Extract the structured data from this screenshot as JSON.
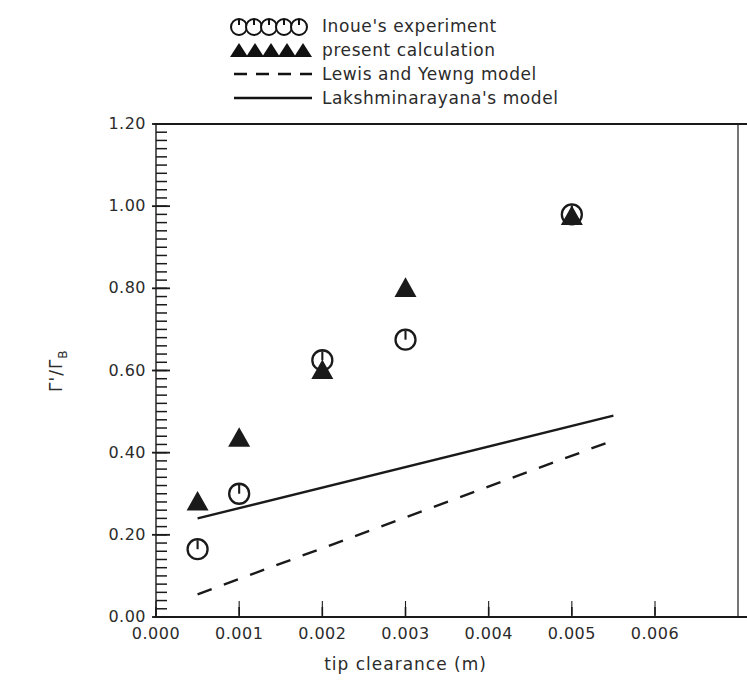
{
  "chart_data": {
    "type": "scatter",
    "title": "",
    "subtitle": "",
    "xlabel": "tip clearance (m)",
    "ylabel": "Γ'/ΓB",
    "ylabel_main": "Γ'/Γ",
    "ylabel_sub": "B",
    "xlim": [
      0.0,
      0.006
    ],
    "ylim": [
      0.0,
      1.2
    ],
    "grid": false,
    "legend_position": "above-plot",
    "xticks": [
      "0.000",
      "0.001",
      "0.002",
      "0.003",
      "0.004",
      "0.005",
      "0.006"
    ],
    "xtick_values": [
      0.0,
      0.001,
      0.002,
      0.003,
      0.004,
      0.005,
      0.006
    ],
    "yticks": [
      "0.00",
      "0.20",
      "0.40",
      "0.60",
      "0.80",
      "1.00",
      "1.20"
    ],
    "ytick_values": [
      0.0,
      0.2,
      0.4,
      0.6,
      0.8,
      1.0,
      1.2
    ],
    "minor_ticks_y": 60,
    "series": [
      {
        "name": "Inoue's experiment",
        "marker": "open-circle",
        "type": "scatter",
        "x": [
          0.0005,
          0.001,
          0.002,
          0.003,
          0.005
        ],
        "y": [
          0.165,
          0.3,
          0.625,
          0.675,
          0.98
        ]
      },
      {
        "name": "present calculation",
        "marker": "filled-triangle",
        "type": "scatter",
        "x": [
          0.0005,
          0.001,
          0.002,
          0.003,
          0.005
        ],
        "y": [
          0.28,
          0.435,
          0.6,
          0.8,
          0.975
        ]
      },
      {
        "name": "Lewis and Yewng model",
        "marker": "dashed-line",
        "type": "line",
        "x": [
          0.0005,
          0.0055
        ],
        "y": [
          0.055,
          0.43
        ]
      },
      {
        "name": "Lakshminarayana's model",
        "marker": "solid-line",
        "type": "line",
        "x": [
          0.0005,
          0.0055
        ],
        "y": [
          0.24,
          0.49
        ]
      }
    ],
    "colors": {
      "axis": "#1a1a1a",
      "marker": "#1a1a1a",
      "line": "#1a1a1a",
      "background": "#ffffff"
    }
  },
  "legend": {
    "entries": [
      {
        "label": "Inoue's experiment",
        "sample": "open-circle-row-icon"
      },
      {
        "label": "present calculation",
        "sample": "filled-triangle-row-icon"
      },
      {
        "label": "Lewis and Yewng model",
        "sample": "dashed-line-icon"
      },
      {
        "label": "Lakshminarayana's model",
        "sample": "solid-line-icon"
      }
    ]
  }
}
